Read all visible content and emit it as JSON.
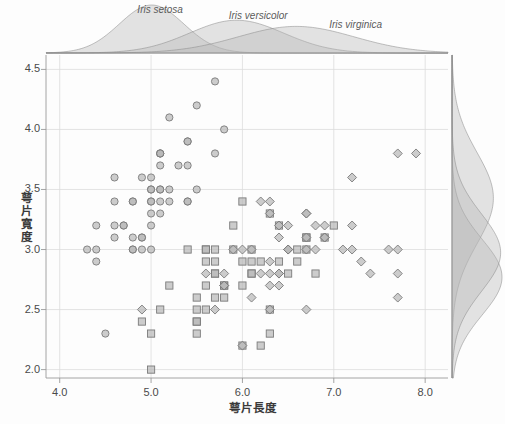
{
  "chart_data": {
    "type": "scatter",
    "title": "",
    "xlabel": "萼片長度",
    "ylabel": "萼片寬度",
    "xlim": [
      3.85,
      8.25
    ],
    "ylim": [
      1.93,
      4.62
    ],
    "xticks": [
      "4.0",
      "5.0",
      "6.0",
      "7.0",
      "8.0"
    ],
    "xtick_values": [
      4.0,
      5.0,
      6.0,
      7.0,
      8.0
    ],
    "yticks": [
      "2.0",
      "2.5",
      "3.0",
      "3.5",
      "4.0",
      "4.5"
    ],
    "ytick_values": [
      2.0,
      2.5,
      3.0,
      3.5,
      4.0,
      4.5
    ],
    "grid": true,
    "legend_position": "inline-annotations",
    "marker_face_color": "#b9b9b9",
    "marker_edge_color": "#7b7b7b",
    "density_fill_color": "#b5b5b5",
    "density_line_color": "#8a8a8a",
    "grid_color": "#dcdcdc",
    "axis_color": "#9a9a9a",
    "background_color": "#fdfdfd",
    "series": [
      {
        "name": "Iris setosa",
        "marker": "circle",
        "annotation": "Iris setosa",
        "annotation_x": 4.85,
        "annotation_y": 4.95,
        "points": [
          [
            5.1,
            3.5
          ],
          [
            4.9,
            3.0
          ],
          [
            4.7,
            3.2
          ],
          [
            4.6,
            3.1
          ],
          [
            5.0,
            3.6
          ],
          [
            5.4,
            3.9
          ],
          [
            4.6,
            3.4
          ],
          [
            5.0,
            3.4
          ],
          [
            4.4,
            2.9
          ],
          [
            4.9,
            3.1
          ],
          [
            5.4,
            3.7
          ],
          [
            4.8,
            3.4
          ],
          [
            4.8,
            3.0
          ],
          [
            4.3,
            3.0
          ],
          [
            5.8,
            4.0
          ],
          [
            5.7,
            4.4
          ],
          [
            5.4,
            3.9
          ],
          [
            5.1,
            3.5
          ],
          [
            5.7,
            3.8
          ],
          [
            5.1,
            3.8
          ],
          [
            5.4,
            3.4
          ],
          [
            5.1,
            3.7
          ],
          [
            4.6,
            3.6
          ],
          [
            5.1,
            3.3
          ],
          [
            4.8,
            3.4
          ],
          [
            5.0,
            3.0
          ],
          [
            5.0,
            3.4
          ],
          [
            5.2,
            3.5
          ],
          [
            5.2,
            3.4
          ],
          [
            4.7,
            3.2
          ],
          [
            4.8,
            3.1
          ],
          [
            5.4,
            3.4
          ],
          [
            5.2,
            4.1
          ],
          [
            5.5,
            4.2
          ],
          [
            4.9,
            3.1
          ],
          [
            5.0,
            3.2
          ],
          [
            5.5,
            3.5
          ],
          [
            4.9,
            3.6
          ],
          [
            4.4,
            3.0
          ],
          [
            5.1,
            3.4
          ],
          [
            5.0,
            3.5
          ],
          [
            4.5,
            2.3
          ],
          [
            4.4,
            3.2
          ],
          [
            5.0,
            3.5
          ],
          [
            5.1,
            3.8
          ],
          [
            4.8,
            3.0
          ],
          [
            5.1,
            3.8
          ],
          [
            4.6,
            3.2
          ],
          [
            5.3,
            3.7
          ],
          [
            5.0,
            3.3
          ]
        ]
      },
      {
        "name": "Iris versicolor",
        "marker": "square",
        "annotation": "Iris versicolor",
        "annotation_x": 5.85,
        "annotation_y": 4.86,
        "points": [
          [
            7.0,
            3.2
          ],
          [
            6.4,
            3.2
          ],
          [
            6.9,
            3.1
          ],
          [
            5.5,
            2.3
          ],
          [
            6.5,
            2.8
          ],
          [
            5.7,
            2.8
          ],
          [
            6.3,
            3.3
          ],
          [
            4.9,
            2.4
          ],
          [
            6.6,
            2.9
          ],
          [
            5.2,
            2.7
          ],
          [
            5.0,
            2.0
          ],
          [
            5.9,
            3.0
          ],
          [
            6.0,
            2.2
          ],
          [
            6.1,
            2.9
          ],
          [
            5.6,
            2.9
          ],
          [
            6.7,
            3.1
          ],
          [
            5.6,
            3.0
          ],
          [
            5.8,
            2.7
          ],
          [
            6.2,
            2.2
          ],
          [
            5.6,
            2.5
          ],
          [
            5.9,
            3.2
          ],
          [
            6.1,
            2.8
          ],
          [
            6.3,
            2.5
          ],
          [
            6.1,
            2.8
          ],
          [
            6.4,
            2.9
          ],
          [
            6.6,
            3.0
          ],
          [
            6.8,
            2.8
          ],
          [
            6.7,
            3.0
          ],
          [
            6.0,
            2.9
          ],
          [
            5.7,
            2.6
          ],
          [
            5.5,
            2.4
          ],
          [
            5.5,
            2.4
          ],
          [
            5.8,
            2.7
          ],
          [
            6.0,
            2.7
          ],
          [
            5.4,
            3.0
          ],
          [
            6.0,
            3.4
          ],
          [
            6.7,
            3.1
          ],
          [
            6.3,
            2.3
          ],
          [
            5.6,
            3.0
          ],
          [
            5.5,
            2.5
          ],
          [
            5.5,
            2.6
          ],
          [
            6.1,
            3.0
          ],
          [
            5.8,
            2.6
          ],
          [
            5.0,
            2.3
          ],
          [
            5.6,
            2.7
          ],
          [
            5.7,
            3.0
          ],
          [
            5.7,
            2.9
          ],
          [
            6.2,
            2.9
          ],
          [
            5.1,
            2.5
          ],
          [
            5.7,
            2.8
          ]
        ]
      },
      {
        "name": "Iris virginica",
        "marker": "diamond",
        "annotation": "Iris virginica",
        "annotation_x": 6.95,
        "annotation_y": 4.72,
        "points": [
          [
            6.3,
            3.3
          ],
          [
            5.8,
            2.7
          ],
          [
            7.1,
            3.0
          ],
          [
            6.3,
            2.9
          ],
          [
            6.5,
            3.0
          ],
          [
            7.6,
            3.0
          ],
          [
            4.9,
            2.5
          ],
          [
            7.3,
            2.9
          ],
          [
            6.7,
            2.5
          ],
          [
            7.2,
            3.6
          ],
          [
            6.5,
            3.2
          ],
          [
            6.4,
            2.7
          ],
          [
            6.8,
            3.0
          ],
          [
            5.7,
            2.5
          ],
          [
            5.8,
            2.8
          ],
          [
            6.4,
            3.2
          ],
          [
            6.5,
            3.0
          ],
          [
            7.7,
            3.8
          ],
          [
            7.7,
            2.6
          ],
          [
            6.0,
            2.2
          ],
          [
            6.9,
            3.2
          ],
          [
            5.6,
            2.8
          ],
          [
            7.7,
            2.8
          ],
          [
            6.3,
            2.7
          ],
          [
            6.7,
            3.3
          ],
          [
            7.2,
            3.2
          ],
          [
            6.2,
            2.8
          ],
          [
            6.1,
            3.0
          ],
          [
            6.4,
            2.8
          ],
          [
            7.2,
            3.0
          ],
          [
            7.4,
            2.8
          ],
          [
            7.9,
            3.8
          ],
          [
            6.4,
            2.8
          ],
          [
            6.3,
            2.8
          ],
          [
            6.1,
            2.6
          ],
          [
            7.7,
            3.0
          ],
          [
            6.3,
            3.4
          ],
          [
            6.4,
            3.1
          ],
          [
            6.0,
            3.0
          ],
          [
            6.9,
            3.1
          ],
          [
            6.7,
            3.1
          ],
          [
            6.9,
            3.1
          ],
          [
            5.8,
            2.7
          ],
          [
            6.8,
            3.2
          ],
          [
            6.7,
            3.3
          ],
          [
            6.7,
            3.0
          ],
          [
            6.3,
            2.5
          ],
          [
            6.5,
            3.0
          ],
          [
            6.2,
            3.4
          ],
          [
            5.9,
            3.0
          ]
        ]
      }
    ],
    "marginal_top": {
      "variable": "萼片長度",
      "kind": "density",
      "series": [
        {
          "name": "Iris setosa",
          "mean": 5.006,
          "sd": 0.3525
        },
        {
          "name": "Iris versicolor",
          "mean": 5.936,
          "sd": 0.5162
        },
        {
          "name": "Iris virginica",
          "mean": 6.588,
          "sd": 0.6359
        }
      ]
    },
    "marginal_right": {
      "variable": "萼片寬度",
      "kind": "density",
      "series": [
        {
          "name": "Iris setosa",
          "mean": 3.428,
          "sd": 0.3791
        },
        {
          "name": "Iris versicolor",
          "mean": 2.77,
          "sd": 0.3138
        },
        {
          "name": "Iris virginica",
          "mean": 2.974,
          "sd": 0.3225
        }
      ]
    }
  }
}
